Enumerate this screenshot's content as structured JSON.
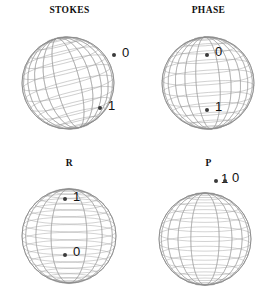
{
  "figure": {
    "name": "bloch-sphere-grid",
    "width": 278,
    "height": 306,
    "background": "#ffffff",
    "wire_color": "#9a9a9a",
    "outline_color": "#8a8a8a",
    "marker_color": "#3a3a3a",
    "label_color": "#111111"
  },
  "panels": [
    {
      "id": "stokes",
      "title": "STOKES",
      "position": {
        "left": 0,
        "top": 0
      },
      "sphere": {
        "cx": 68,
        "cy": 83,
        "r": 46,
        "tilt_deg": -14,
        "meridians": 12,
        "parallels": 13
      },
      "markers": [
        {
          "label": "0",
          "dot_x": 114,
          "dot_y": 55,
          "label_x": 122,
          "label_y": 46
        },
        {
          "label": "1",
          "dot_x": 100,
          "dot_y": 108,
          "label_x": 108,
          "label_y": 99
        }
      ]
    },
    {
      "id": "phase",
      "title": "PHASE",
      "position": {
        "left": 139,
        "top": 0
      },
      "sphere": {
        "cx": 69,
        "cy": 83,
        "r": 46,
        "tilt_deg": -4,
        "meridians": 12,
        "parallels": 13
      },
      "markers": [
        {
          "label": "0",
          "dot_x": 68,
          "dot_y": 55,
          "label_x": 76,
          "label_y": 45
        },
        {
          "label": "1",
          "dot_x": 68,
          "dot_y": 110,
          "label_x": 76,
          "label_y": 100
        }
      ]
    },
    {
      "id": "r",
      "title": "R",
      "position": {
        "left": 0,
        "top": 153
      },
      "sphere": {
        "cx": 69,
        "cy": 83,
        "r": 47,
        "tilt_deg": 0,
        "meridians": 8,
        "parallels": 19
      },
      "markers": [
        {
          "label": "1",
          "dot_x": 65,
          "dot_y": 46,
          "label_x": 73,
          "label_y": 37
        },
        {
          "label": "0",
          "dot_x": 65,
          "dot_y": 102,
          "label_x": 73,
          "label_y": 92
        }
      ]
    },
    {
      "id": "p",
      "title": "P",
      "position": {
        "left": 139,
        "top": 153
      },
      "sphere": {
        "cx": 66,
        "cy": 86,
        "r": 46,
        "tilt_deg": 0,
        "meridians": 10,
        "parallels": 15
      },
      "markers": [
        {
          "label": "1",
          "dot_x": 77,
          "dot_y": 28,
          "label_x": 82,
          "label_y": 19
        },
        {
          "label": "0",
          "dot_x": 86,
          "dot_y": 28,
          "label_x": 93,
          "label_y": 18
        }
      ]
    }
  ]
}
